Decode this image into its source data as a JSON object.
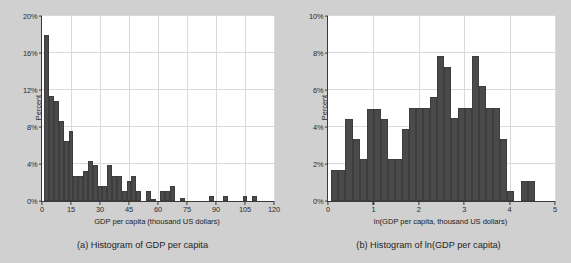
{
  "figure": {
    "background_color": "#d0d0d0",
    "bar_color": "#4a4a4a",
    "plot_background": "#ffffff",
    "grid_color": "#d9d9d9"
  },
  "panels": [
    {
      "id": "panel-a",
      "caption": "(a) Histogram of GDP per capita",
      "chart_index": 0
    },
    {
      "id": "panel-b",
      "caption": "(b) Histogram of ln(GDP per capita)",
      "chart_index": 1
    }
  ],
  "chart_data": [
    {
      "type": "bar",
      "title": "",
      "xlabel": "GDP per capita (thousand US dollars)",
      "ylabel": "Percent",
      "xlim": [
        0,
        120
      ],
      "ylim": [
        0,
        20
      ],
      "xticks": [
        0,
        15,
        30,
        45,
        60,
        75,
        90,
        105,
        120
      ],
      "xtick_labels": [
        "0",
        "15",
        "30",
        "45",
        "60",
        "75",
        "90",
        "105",
        "120"
      ],
      "yticks": [
        0,
        4,
        8,
        12,
        16,
        20
      ],
      "ytick_labels": [
        "0%",
        "4%",
        "8%",
        "12%",
        "16%",
        "20%"
      ],
      "grid": true,
      "legend": "none",
      "bin_width": 2.5,
      "bin_starts": [
        1.25,
        3.75,
        6.25,
        8.75,
        11.25,
        13.75,
        16.25,
        18.75,
        21.25,
        23.75,
        26.25,
        28.75,
        31.25,
        33.75,
        36.25,
        38.75,
        41.25,
        43.75,
        46.25,
        48.75,
        53.75,
        56.25,
        61.25,
        63.75,
        66.25,
        71.25,
        86.25,
        93.75,
        103.75,
        108.75
      ],
      "values": [
        18.0,
        11.3,
        10.8,
        8.7,
        6.5,
        7.6,
        2.7,
        2.7,
        3.25,
        4.3,
        3.85,
        1.6,
        1.6,
        3.85,
        2.7,
        2.7,
        1.1,
        2.15,
        2.7,
        1.1,
        1.1,
        0.25,
        1.1,
        1.1,
        1.6,
        0.35,
        0.5,
        0.55,
        0.5,
        0.55
      ]
    },
    {
      "type": "bar",
      "title": "",
      "xlabel": "ln(GDP per capita, thousand US dollars)",
      "ylabel": "Percent",
      "xlim": [
        0,
        5
      ],
      "ylim": [
        0,
        10
      ],
      "xticks": [
        0,
        1,
        2,
        3,
        4,
        5
      ],
      "xtick_labels": [
        "0",
        "1",
        "2",
        "3",
        "4",
        "5"
      ],
      "yticks": [
        0,
        2,
        4,
        6,
        8,
        10
      ],
      "ytick_labels": [
        "0%",
        "2%",
        "4%",
        "6%",
        "8%",
        "10%"
      ],
      "grid": true,
      "legend": "none",
      "bin_width": 0.155,
      "bin_starts": [
        0.075,
        0.23,
        0.385,
        0.54,
        0.695,
        0.85,
        1.005,
        1.16,
        1.315,
        1.47,
        1.625,
        1.78,
        1.935,
        2.09,
        2.245,
        2.4,
        2.555,
        2.71,
        2.865,
        3.02,
        3.175,
        3.33,
        3.485,
        3.64,
        3.795,
        3.95,
        4.105,
        4.26,
        4.415,
        4.57
      ],
      "values": [
        1.7,
        1.7,
        4.45,
        3.35,
        2.25,
        5.0,
        5.0,
        4.45,
        2.25,
        2.25,
        3.9,
        5.05,
        5.05,
        5.05,
        5.6,
        7.85,
        7.25,
        4.5,
        5.05,
        5.05,
        7.85,
        6.2,
        5.05,
        5.05,
        3.35,
        0.55,
        0.0,
        1.1,
        1.1,
        0.0
      ]
    }
  ]
}
